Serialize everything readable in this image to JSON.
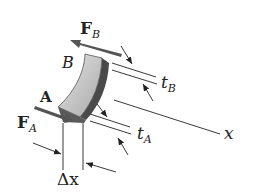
{
  "diagram": {
    "type": "thin-walled tube element (shear flow)",
    "labels": {
      "force_b_main": "F",
      "force_b_sub": "B",
      "point_b": "B",
      "point_a": "A",
      "force_a_main": "F",
      "force_a_sub": "A",
      "thickness_b_main": "t",
      "thickness_b_sub": "B",
      "thickness_a_main": "t",
      "thickness_a_sub": "A",
      "axis_x": "x",
      "delta_x": "Δx"
    },
    "colors": {
      "force_arrow": "#555555",
      "element_face": "#c8c8c8",
      "element_edge": "#4a4a4a",
      "line": "#222222",
      "background": "#ffffff"
    }
  }
}
